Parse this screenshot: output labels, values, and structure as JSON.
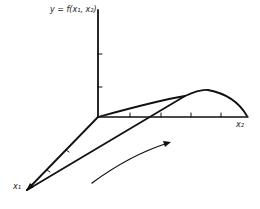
{
  "labels": {
    "y_axis": "y = f(x₁, x₂)",
    "x2_axis": "x₂",
    "x1_axis": "x₁"
  },
  "colors": {
    "ink": "#111111",
    "background": "#ffffff"
  }
}
